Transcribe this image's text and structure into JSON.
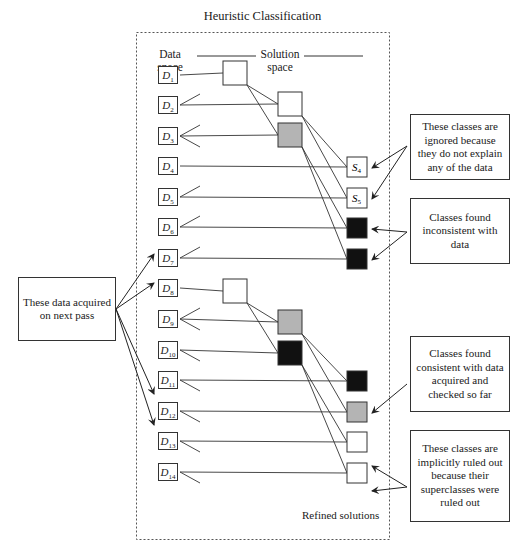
{
  "title": "Heuristic Classification",
  "column_labels": {
    "data_space": [
      "Data",
      "space"
    ],
    "solution_space": [
      "Solution",
      "space"
    ],
    "refined_solutions": "Refined solutions"
  },
  "data_nodes": [
    {
      "label": "D",
      "sub": "1",
      "y": 66
    },
    {
      "label": "D",
      "sub": "2",
      "y": 96
    },
    {
      "label": "D",
      "sub": "3",
      "y": 127
    },
    {
      "label": "D",
      "sub": "4",
      "y": 157
    },
    {
      "label": "D",
      "sub": "5",
      "y": 188
    },
    {
      "label": "D",
      "sub": "6",
      "y": 218
    },
    {
      "label": "D",
      "sub": "7",
      "y": 249
    },
    {
      "label": "D",
      "sub": "8",
      "y": 279
    },
    {
      "label": "D",
      "sub": "9",
      "y": 310
    },
    {
      "label": "D",
      "sub": "10",
      "y": 341
    },
    {
      "label": "D",
      "sub": "11",
      "y": 371
    },
    {
      "label": "D",
      "sub": "12",
      "y": 402
    },
    {
      "label": "D",
      "sub": "13",
      "y": 432
    },
    {
      "label": "D",
      "sub": "14",
      "y": 463
    }
  ],
  "solution_nodes": [
    {
      "id": "A",
      "level": 1,
      "fill": "#ffffff",
      "x": 223,
      "y": 61,
      "size": 24
    },
    {
      "id": "B",
      "level": 2,
      "fill": "#ffffff",
      "x": 278,
      "y": 92,
      "size": 24
    },
    {
      "id": "C",
      "level": 2,
      "fill": "#b4b4b4",
      "x": 278,
      "y": 123,
      "size": 24
    },
    {
      "id": "S4",
      "level": 3,
      "fill": "#ffffff",
      "x": 347,
      "y": 157,
      "size": 20,
      "label": "S",
      "sub": "4"
    },
    {
      "id": "S5",
      "level": 3,
      "fill": "#ffffff",
      "x": 347,
      "y": 188,
      "size": 20,
      "label": "S",
      "sub": "5"
    },
    {
      "id": "K6",
      "level": 3,
      "fill": "#111111",
      "x": 347,
      "y": 218,
      "size": 20
    },
    {
      "id": "K7",
      "level": 3,
      "fill": "#111111",
      "x": 347,
      "y": 249,
      "size": 20
    },
    {
      "id": "E",
      "level": 1,
      "fill": "#ffffff",
      "x": 223,
      "y": 279,
      "size": 24
    },
    {
      "id": "F",
      "level": 2,
      "fill": "#b4b4b4",
      "x": 278,
      "y": 310,
      "size": 24
    },
    {
      "id": "G",
      "level": 2,
      "fill": "#111111",
      "x": 278,
      "y": 341,
      "size": 24
    },
    {
      "id": "K11",
      "level": 3,
      "fill": "#111111",
      "x": 347,
      "y": 371,
      "size": 20
    },
    {
      "id": "G12",
      "level": 3,
      "fill": "#b4b4b4",
      "x": 347,
      "y": 402,
      "size": 20
    },
    {
      "id": "W13",
      "level": 3,
      "fill": "#ffffff",
      "x": 347,
      "y": 432,
      "size": 20
    },
    {
      "id": "W14",
      "level": 3,
      "fill": "#ffffff",
      "x": 347,
      "y": 463,
      "size": 20
    }
  ],
  "notes": [
    {
      "id": "ignored",
      "text": "These classes are ignored because they do not explain any of the data"
    },
    {
      "id": "inconsistent",
      "text": "Classes found inconsistent with data"
    },
    {
      "id": "next-pass",
      "text": "These data acquired on next pass"
    },
    {
      "id": "consistent",
      "text": "Classes found consistent with data acquired and checked so far"
    },
    {
      "id": "implicit",
      "text": "These classes are implicitly ruled out because their superclasses were ruled out"
    }
  ],
  "colors": {
    "line": "#333333",
    "gray_node": "#b4b4b4",
    "black_node": "#111111",
    "frame": "#555555"
  }
}
